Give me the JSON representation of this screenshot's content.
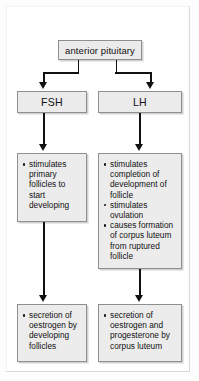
{
  "diagram": {
    "colors": {
      "box_fill": "#ebebeb",
      "box_border": "#8f8f8f",
      "connector": "#111111",
      "background": "#ffffff"
    },
    "nodes": {
      "source": {
        "id": "anterior-pituitary",
        "label": "anterior pituitary"
      },
      "fsh": {
        "id": "fsh",
        "label": "FSH"
      },
      "lh": {
        "id": "lh",
        "label": "LH"
      },
      "fsh_effects": {
        "id": "fsh-effects",
        "bullets": [
          "stimulates primary follicles to start developing"
        ]
      },
      "lh_effects": {
        "id": "lh-effects",
        "bullets": [
          "stimulates completion of development of follicle",
          "stimulates ovulation",
          "causes formation of corpus luteum from ruptured follicle"
        ]
      },
      "fsh_outcome": {
        "id": "fsh-outcome",
        "bullets": [
          "secretion of oestrogen by developing follicles"
        ]
      },
      "lh_outcome": {
        "id": "lh-outcome",
        "bullets": [
          "secretion of oestrogen and progesterone by corpus luteum"
        ]
      }
    }
  }
}
